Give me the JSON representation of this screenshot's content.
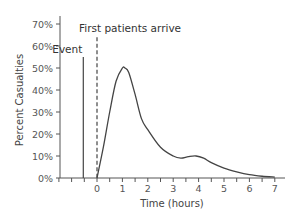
{
  "chart_data": {
    "type": "line",
    "title": "",
    "xlabel": "Time (hours)",
    "ylabel": "Percent Casualties",
    "xlim": [
      -1.5,
      7.2
    ],
    "ylim": [
      0,
      70
    ],
    "x_ticks": [
      "0",
      "1",
      "2",
      "3",
      "4",
      "5",
      "6",
      "7"
    ],
    "y_ticks": [
      "0%",
      "10%",
      "20%",
      "30%",
      "40%",
      "50%",
      "60%",
      "70%"
    ],
    "grid": false,
    "series": [
      {
        "name": "Percent Casualties",
        "x": [
          0,
          0.25,
          0.5,
          0.75,
          1.0,
          1.1,
          1.25,
          1.5,
          1.75,
          2.0,
          2.5,
          3.0,
          3.3,
          3.6,
          3.9,
          4.2,
          4.5,
          5.0,
          5.5,
          6.0,
          6.5,
          7.0
        ],
        "values": [
          0,
          14,
          30,
          44,
          50,
          50,
          48,
          38,
          27,
          22,
          14,
          10,
          9,
          9.7,
          10,
          9,
          7,
          4.5,
          2.8,
          1.5,
          0.8,
          0.4
        ]
      }
    ],
    "annotations": [
      {
        "label": "Event",
        "x": -0.5,
        "style": "solid-vertical-line",
        "top_value": 55
      },
      {
        "label": "First patients arrive",
        "x": 0,
        "style": "dashed-vertical-line",
        "top_value": 64
      }
    ]
  }
}
